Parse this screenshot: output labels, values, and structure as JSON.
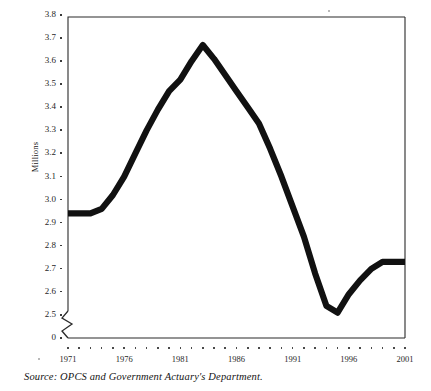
{
  "figure": {
    "ylabel": "Millions",
    "source_note": "Source: OPCS and Government Actuary's Department.",
    "line_color": "#111111",
    "frame_color": "#2b2b2b"
  },
  "chart_data": {
    "type": "line",
    "title": "",
    "xlabel": "",
    "ylabel": "Millions",
    "grid": false,
    "legend": false,
    "axis_break": true,
    "axis_break_note": "y-axis broken between 0 and 2.5",
    "xlim": [
      1971,
      2001
    ],
    "ylim": [
      2.5,
      3.8
    ],
    "ytick_labels": [
      "3.8",
      "3.7",
      "3.6",
      "3.5",
      "3.4",
      "3.3",
      "3.2",
      "3.1",
      "3.0",
      "2.9",
      "2.8",
      "2.7",
      "2.6",
      "2.5",
      "0"
    ],
    "ytick_values": [
      3.8,
      3.7,
      3.6,
      3.5,
      3.4,
      3.3,
      3.2,
      3.1,
      3.0,
      2.9,
      2.8,
      2.7,
      2.6,
      2.5,
      0
    ],
    "xtick_labels": [
      "1971",
      "1976",
      "1981",
      "1986",
      "1991",
      "1996",
      "2001"
    ],
    "xtick_values": [
      1971,
      1976,
      1981,
      1986,
      1991,
      1996,
      2001
    ],
    "x": [
      1971,
      1972,
      1973,
      1974,
      1975,
      1976,
      1977,
      1978,
      1979,
      1980,
      1981,
      1982,
      1983,
      1984,
      1985,
      1986,
      1987,
      1988,
      1989,
      1990,
      1991,
      1992,
      1993,
      1994,
      1995,
      1996,
      1997,
      1998,
      1999,
      2000,
      2001
    ],
    "series": [
      {
        "name": "Population",
        "values": [
          2.94,
          2.94,
          2.94,
          2.96,
          3.02,
          3.1,
          3.2,
          3.3,
          3.39,
          3.47,
          3.52,
          3.6,
          3.67,
          3.61,
          3.54,
          3.47,
          3.4,
          3.33,
          3.22,
          3.1,
          2.97,
          2.84,
          2.68,
          2.54,
          2.51,
          2.59,
          2.65,
          2.7,
          2.73,
          2.73,
          2.73
        ]
      }
    ]
  }
}
